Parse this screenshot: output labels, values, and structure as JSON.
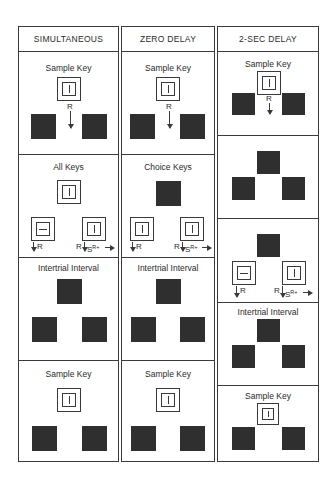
{
  "columns": [
    {
      "header": "SIMULTANEOUS",
      "panels": [
        {
          "label": "Sample Key",
          "sample_key": "vertical-line",
          "response": "R"
        },
        {
          "label": "All Keys",
          "center_key": "vertical-line",
          "left_key": "horizontal-line",
          "right_key": "vertical-line",
          "left_annotation": "R",
          "right_annotation_r": "R",
          "right_annotation_s": "S",
          "right_annotation_sup": "R+"
        },
        {
          "label": "Intertrial Interval"
        },
        {
          "label": "Sample Key",
          "sample_key": "vertical-line"
        }
      ]
    },
    {
      "header": "ZERO DELAY",
      "panels": [
        {
          "label": "Sample Key",
          "sample_key": "vertical-line",
          "response": "R"
        },
        {
          "label": "Choice Keys",
          "left_key": "vertical-line",
          "right_key": "vertical-line",
          "left_annotation": "R",
          "right_annotation_r": "R",
          "right_annotation_s": "S",
          "right_annotation_sup": "R+"
        },
        {
          "label": "Intertrial Interval"
        },
        {
          "label": "Sample Key",
          "sample_key": "vertical-line"
        }
      ]
    },
    {
      "header": "2-SEC DELAY",
      "panels": [
        {
          "label": "Sample Key",
          "sample_key": "vertical-line",
          "response": "R"
        },
        {
          "label": ""
        },
        {
          "label": "",
          "left_key": "horizontal-line",
          "right_key": "vertical-line",
          "left_annotation": "R",
          "right_annotation_r": "R",
          "right_annotation_s": "S",
          "right_annotation_sup": "R+"
        },
        {
          "label": "Intertrial Interval"
        },
        {
          "label": "Sample Key",
          "sample_key": "vertical-line"
        }
      ]
    }
  ]
}
